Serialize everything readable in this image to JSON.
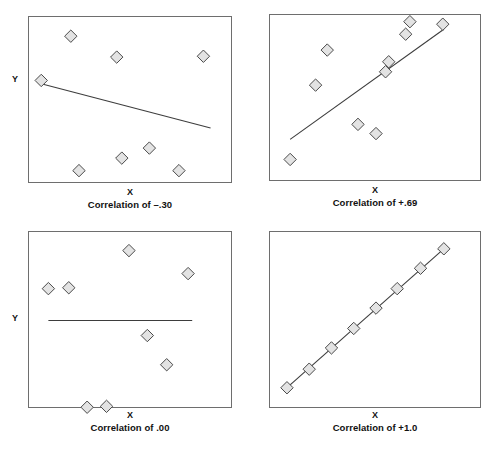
{
  "figure": {
    "title": "",
    "background_color": "#ffffff",
    "frame_color": "#6e6e6e",
    "marker_fill": "#e3e3e3",
    "marker_stroke": "#4a4a4a",
    "line_color": "#3d3d3d"
  },
  "panels": [
    {
      "id": "panel-correlation-negative-30",
      "caption": "Correlation of –.30",
      "x_label": "X",
      "y_label": "Y"
    },
    {
      "id": "panel-correlation-positive-69",
      "caption": "Correlation of +.69",
      "x_label": "X",
      "y_label": "Y"
    },
    {
      "id": "panel-correlation-zero",
      "caption": "Correlation of .00",
      "x_label": "X",
      "y_label": "Y"
    },
    {
      "id": "panel-correlation-positive-10",
      "caption": "Correlation of +1.0",
      "x_label": "X",
      "y_label": "Y"
    }
  ],
  "chart_data": [
    {
      "type": "scatter",
      "title": "Correlation of –.30",
      "xlabel": "X",
      "ylabel": "Y",
      "correlation": -0.3,
      "xlim": [
        0,
        1
      ],
      "ylim": [
        0,
        1
      ],
      "grid": false,
      "legend": "none",
      "points": [
        {
          "x": 0.205,
          "y": 0.885
        },
        {
          "x": 0.06,
          "y": 0.62
        },
        {
          "x": 0.43,
          "y": 0.76
        },
        {
          "x": 0.855,
          "y": 0.765
        },
        {
          "x": 0.59,
          "y": 0.215
        },
        {
          "x": 0.455,
          "y": 0.155
        },
        {
          "x": 0.245,
          "y": 0.08
        },
        {
          "x": 0.735,
          "y": 0.08
        }
      ],
      "trend_line": {
        "x0": 0.06,
        "y0": 0.6,
        "x1": 0.89,
        "y1": 0.335
      }
    },
    {
      "type": "scatter",
      "title": "Correlation of +.69",
      "xlabel": "X",
      "ylabel": "Y",
      "correlation": 0.69,
      "xlim": [
        0,
        1
      ],
      "ylim": [
        0,
        1
      ],
      "grid": false,
      "legend": "none",
      "points": [
        {
          "x": 0.095,
          "y": 0.135
        },
        {
          "x": 0.215,
          "y": 0.58
        },
        {
          "x": 0.27,
          "y": 0.79
        },
        {
          "x": 0.415,
          "y": 0.345
        },
        {
          "x": 0.5,
          "y": 0.29
        },
        {
          "x": 0.545,
          "y": 0.66
        },
        {
          "x": 0.56,
          "y": 0.72
        },
        {
          "x": 0.64,
          "y": 0.885
        },
        {
          "x": 0.66,
          "y": 0.96
        },
        {
          "x": 0.815,
          "y": 0.945
        }
      ],
      "trend_line": {
        "x0": 0.095,
        "y0": 0.255,
        "x1": 0.82,
        "y1": 0.915
      }
    },
    {
      "type": "scatter",
      "title": "Correlation of .00",
      "xlabel": "X",
      "ylabel": "Y",
      "correlation": 0.0,
      "xlim": [
        0,
        1
      ],
      "ylim": [
        0,
        1
      ],
      "grid": false,
      "legend": "none",
      "points": [
        {
          "x": 0.095,
          "y": 0.68
        },
        {
          "x": 0.195,
          "y": 0.685
        },
        {
          "x": 0.49,
          "y": 0.895
        },
        {
          "x": 0.78,
          "y": 0.765
        },
        {
          "x": 0.58,
          "y": 0.415
        },
        {
          "x": 0.675,
          "y": 0.25
        },
        {
          "x": 0.285,
          "y": 0.01
        },
        {
          "x": 0.38,
          "y": 0.015
        }
      ],
      "trend_line": {
        "x0": 0.095,
        "y0": 0.5,
        "x1": 0.8,
        "y1": 0.5
      }
    },
    {
      "type": "scatter",
      "title": "Correlation of +1.0",
      "xlabel": "X",
      "ylabel": "Y",
      "correlation": 1.0,
      "xlim": [
        0,
        1
      ],
      "ylim": [
        0,
        1
      ],
      "grid": false,
      "legend": "none",
      "points": [
        {
          "x": 0.08,
          "y": 0.12
        },
        {
          "x": 0.185,
          "y": 0.225
        },
        {
          "x": 0.29,
          "y": 0.345
        },
        {
          "x": 0.395,
          "y": 0.455
        },
        {
          "x": 0.5,
          "y": 0.57
        },
        {
          "x": 0.6,
          "y": 0.68
        },
        {
          "x": 0.71,
          "y": 0.795
        },
        {
          "x": 0.82,
          "y": 0.905
        }
      ],
      "trend_line": {
        "x0": 0.075,
        "y0": 0.115,
        "x1": 0.825,
        "y1": 0.91
      }
    }
  ]
}
